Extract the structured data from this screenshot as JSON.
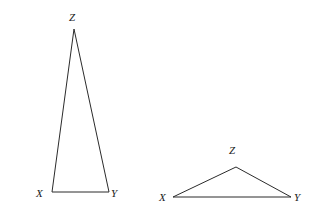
{
  "figure": {
    "background_color": "#ffffff",
    "stroke_color": "#2b2b2b",
    "label_color": "#1a1a1a",
    "stroke_width": 1,
    "width": 329,
    "height": 219,
    "triangles": [
      {
        "name": "left-triangle",
        "shape": "tall narrow isosceles triangle",
        "points": "74,29 52,192 109,192",
        "vertices": [
          {
            "label": "Z",
            "x": 74,
            "y": 29
          },
          {
            "label": "X",
            "x": 52,
            "y": 192
          },
          {
            "label": "Y",
            "x": 109,
            "y": 192
          }
        ]
      },
      {
        "name": "right-triangle",
        "shape": "short wide obtuse triangle",
        "points": "236,167 173,197 291,197",
        "vertices": [
          {
            "label": "Z",
            "x": 236,
            "y": 167
          },
          {
            "label": "X",
            "x": 173,
            "y": 197
          },
          {
            "label": "Y",
            "x": 291,
            "y": 197
          }
        ]
      }
    ],
    "labels": {
      "left_z": "Z",
      "left_x": "X",
      "left_y": "Y",
      "right_z": "Z",
      "right_x": "X",
      "right_y": "Y"
    }
  }
}
